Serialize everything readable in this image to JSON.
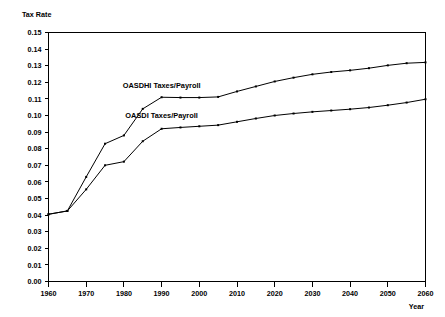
{
  "chart_data": {
    "type": "line",
    "title": "",
    "xlabel": "Year",
    "ylabel": "Tax Rate",
    "xlim": [
      1960,
      2060
    ],
    "ylim": [
      0.0,
      0.15
    ],
    "grid": false,
    "legend_position": "inline-annotation",
    "x_ticks": [
      1960,
      1970,
      1980,
      1990,
      2000,
      2010,
      2020,
      2030,
      2040,
      2050,
      2060
    ],
    "x_tick_labels": [
      "1960",
      "1970",
      "1980",
      "1990",
      "2000",
      "2010",
      "2020",
      "2030",
      "2040",
      "2050",
      "2060"
    ],
    "y_ticks": [
      0.0,
      0.01,
      0.02,
      0.03,
      0.04,
      0.05,
      0.06,
      0.07,
      0.08,
      0.09,
      0.1,
      0.11,
      0.12,
      0.13,
      0.14,
      0.15
    ],
    "y_tick_labels": [
      "0.00",
      "0.01",
      "0.02",
      "0.03",
      "0.04",
      "0.05",
      "0.06",
      "0.07",
      "0.08",
      "0.09",
      "0.10",
      "0.11",
      "0.12",
      "0.13",
      "0.14",
      "0.15"
    ],
    "series": [
      {
        "name": "OASDHI Taxes/Payroll",
        "label": "OASDHI Taxes/Payroll",
        "label_x": 1990,
        "label_y": 0.1165,
        "x": [
          1960,
          1965,
          1970,
          1975,
          1980,
          1985,
          1990,
          1995,
          2000,
          2005,
          2010,
          2015,
          2020,
          2025,
          2030,
          2035,
          2040,
          2045,
          2050,
          2055,
          2060
        ],
        "values": [
          0.0405,
          0.0425,
          0.063,
          0.083,
          0.088,
          0.104,
          0.111,
          0.1108,
          0.1108,
          0.1112,
          0.1145,
          0.1175,
          0.1205,
          0.1228,
          0.1248,
          0.1262,
          0.1272,
          0.1285,
          0.1302,
          0.1315,
          0.132
        ]
      },
      {
        "name": "OASDI Taxes/Payroll",
        "label": "OASDI Taxes/Payroll",
        "label_x": 1990,
        "label_y": 0.0985,
        "x": [
          1960,
          1965,
          1970,
          1975,
          1980,
          1985,
          1990,
          1995,
          2000,
          2005,
          2010,
          2015,
          2020,
          2025,
          2030,
          2035,
          2040,
          2045,
          2050,
          2055,
          2060
        ],
        "values": [
          0.0405,
          0.0425,
          0.0555,
          0.07,
          0.0722,
          0.0845,
          0.092,
          0.0928,
          0.0935,
          0.0942,
          0.0962,
          0.0982,
          0.1,
          0.1012,
          0.1022,
          0.103,
          0.1038,
          0.1048,
          0.1062,
          0.1078,
          0.1098
        ]
      }
    ]
  }
}
